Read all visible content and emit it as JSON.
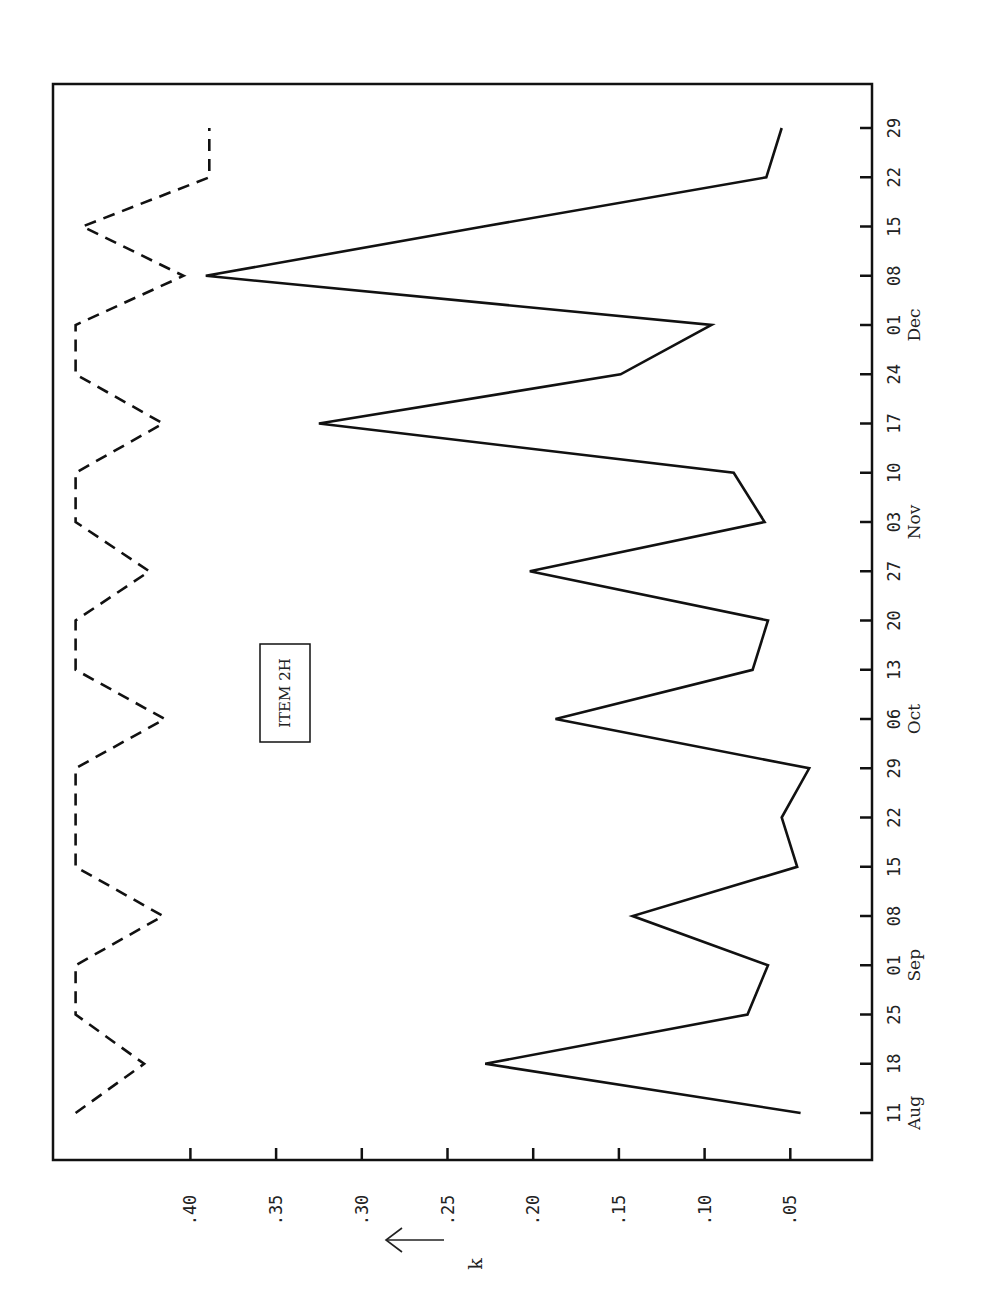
{
  "chart_data": {
    "type": "line",
    "orientation": "rotated-90deg (values increase leftward, dates increase upward)",
    "title": "",
    "annotation": "ITEM 2H",
    "xlabel": "",
    "ylabel": "k",
    "ylabel_arrow": "←",
    "ylim": [
      0.0,
      0.47
    ],
    "y_ticks": [
      ".40",
      ".35",
      ".30",
      ".25",
      ".20",
      ".15",
      ".10",
      ".05"
    ],
    "y_tick_values": [
      0.4,
      0.35,
      0.3,
      0.25,
      0.2,
      0.15,
      0.1,
      0.05
    ],
    "x_tick_labels": [
      "11",
      "18",
      "25",
      "01",
      "08",
      "15",
      "22",
      "29",
      "06",
      "13",
      "20",
      "27",
      "03",
      "10",
      "17",
      "24",
      "01",
      "08",
      "15",
      "22",
      "29"
    ],
    "month_labels": [
      {
        "label": "Aug",
        "at_index": 0
      },
      {
        "label": "Sep",
        "at_index": 3
      },
      {
        "label": "Oct",
        "at_index": 8
      },
      {
        "label": "Nov",
        "at_index": 12
      },
      {
        "label": "Dec",
        "at_index": 16
      }
    ],
    "categories": [
      "Aug 11",
      "Aug 18",
      "Aug 25",
      "Sep 01",
      "Sep 08",
      "Sep 15",
      "Sep 22",
      "Sep 29",
      "Oct 06",
      "Oct 13",
      "Oct 20",
      "Oct 27",
      "Nov 03",
      "Nov 10",
      "Nov 17",
      "Nov 24",
      "Dec 01",
      "Dec 08",
      "Dec 15",
      "Dec 22",
      "Dec 29"
    ],
    "grid": false,
    "legend": "none",
    "series": [
      {
        "name": "solid",
        "style": "solid",
        "values": [
          0.044,
          0.228,
          0.075,
          0.063,
          0.142,
          0.046,
          0.055,
          0.039,
          0.187,
          0.072,
          0.063,
          0.202,
          0.065,
          0.083,
          0.325,
          0.149,
          0.096,
          0.391,
          0.229,
          0.064,
          0.055
        ]
      },
      {
        "name": "dashed",
        "style": "dashed",
        "values": [
          0.467,
          0.427,
          0.467,
          0.467,
          0.416,
          0.467,
          0.467,
          0.467,
          0.415,
          0.467,
          0.467,
          0.424,
          0.467,
          0.467,
          0.416,
          0.467,
          0.467,
          0.404,
          0.463,
          0.389,
          0.389
        ]
      }
    ]
  },
  "labels": {
    "item": "ITEM  2H",
    "axis_name": "k",
    "arrow": "⟵"
  },
  "layout": {
    "frame": {
      "left": 53,
      "top": 84,
      "right": 872,
      "bottom": 1160
    },
    "k_zero_x": 876,
    "px_per_k": 1714,
    "date_first_y": 1113,
    "date_step_y": -49.25
  }
}
